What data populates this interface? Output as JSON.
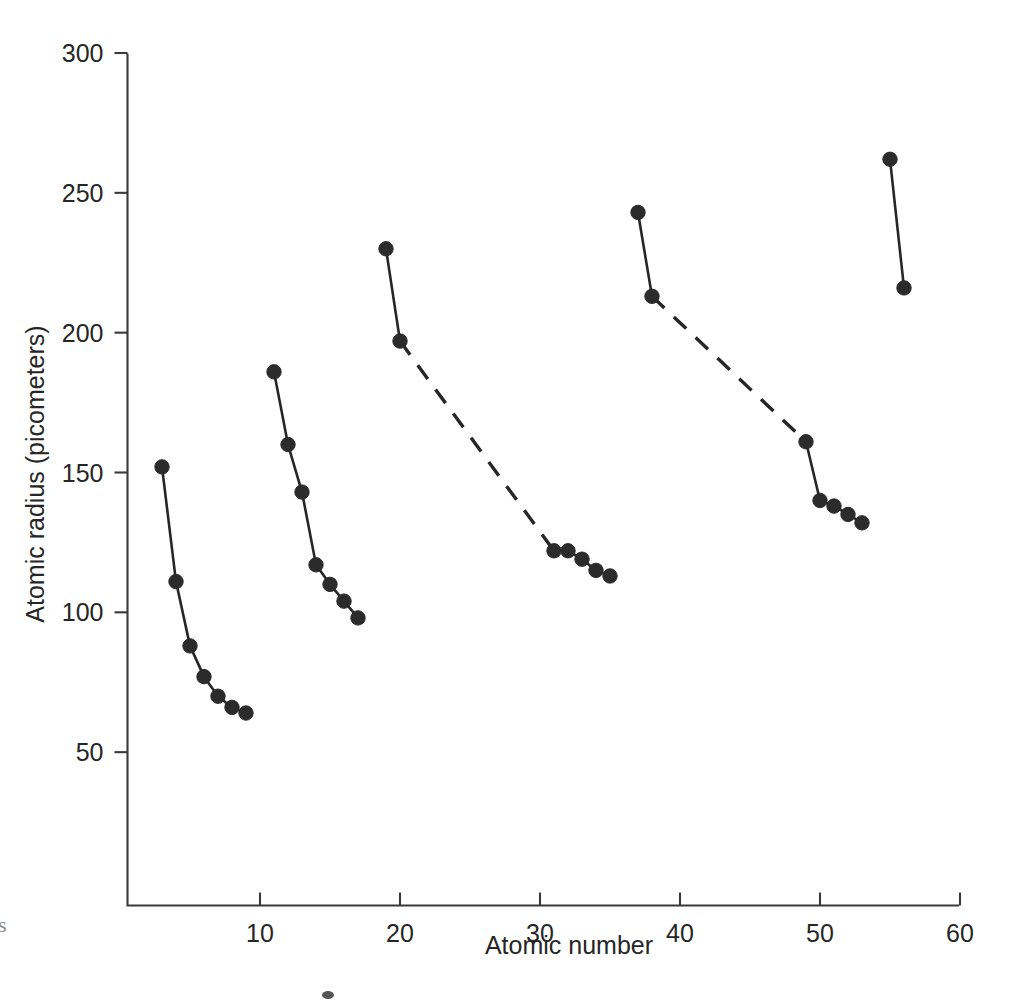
{
  "figure": {
    "background_color": "#ffffff",
    "ink_color": "#262626",
    "edge_artifact_glyph": "s",
    "speck_artifact": "▪"
  },
  "chart_data": {
    "type": "line",
    "title": "",
    "subtitle": "",
    "xlabel": "Atomic number",
    "ylabel": "Atomic radius (picometers)",
    "xlim": [
      0,
      60
    ],
    "ylim": [
      0,
      300
    ],
    "xticks": [
      10,
      20,
      30,
      40,
      50,
      60
    ],
    "xtick_labels": [
      "10",
      "20",
      "30",
      "40",
      "50",
      "60"
    ],
    "yticks": [
      50,
      100,
      150,
      200,
      250,
      300
    ],
    "ytick_labels": [
      "50",
      "100",
      "150",
      "200",
      "250",
      "300"
    ],
    "grid": false,
    "legend": null,
    "legend_position": "none",
    "marker": "filled-circle",
    "annotations": [],
    "series": [
      {
        "name": "Period 2 (Li-F)",
        "line_style": "solid",
        "x": [
          3,
          4,
          5,
          6,
          7,
          8,
          9
        ],
        "y": [
          152,
          111,
          88,
          77,
          70,
          66,
          64
        ]
      },
      {
        "name": "Period 3 (Na-Cl)",
        "line_style": "solid",
        "x": [
          11,
          12,
          13,
          14,
          15,
          16,
          17
        ],
        "y": [
          186,
          160,
          143,
          117,
          110,
          104,
          98
        ]
      },
      {
        "name": "Period 4 start (K-Ca)",
        "line_style": "solid",
        "x": [
          19,
          20
        ],
        "y": [
          230,
          197
        ]
      },
      {
        "name": "Period 4 transition gap (Ca-Ga)",
        "line_style": "dashed",
        "x": [
          20,
          31
        ],
        "y": [
          197,
          122
        ]
      },
      {
        "name": "Period 4 end (Ga-Br)",
        "line_style": "solid",
        "x": [
          31,
          32,
          33,
          34,
          35
        ],
        "y": [
          122,
          122,
          119,
          115,
          113
        ]
      },
      {
        "name": "Period 5 start (Rb-Sr)",
        "line_style": "solid",
        "x": [
          37,
          38
        ],
        "y": [
          243,
          213
        ]
      },
      {
        "name": "Period 5 transition gap (Sr-In)",
        "line_style": "dashed",
        "x": [
          38,
          49
        ],
        "y": [
          213,
          161
        ]
      },
      {
        "name": "Period 5 end (In-I)",
        "line_style": "solid",
        "x": [
          49,
          50,
          51,
          52,
          53
        ],
        "y": [
          161,
          140,
          138,
          135,
          132
        ]
      },
      {
        "name": "Period 6 start (Cs-Ba)",
        "line_style": "solid",
        "x": [
          55,
          56
        ],
        "y": [
          262,
          216
        ]
      }
    ]
  }
}
